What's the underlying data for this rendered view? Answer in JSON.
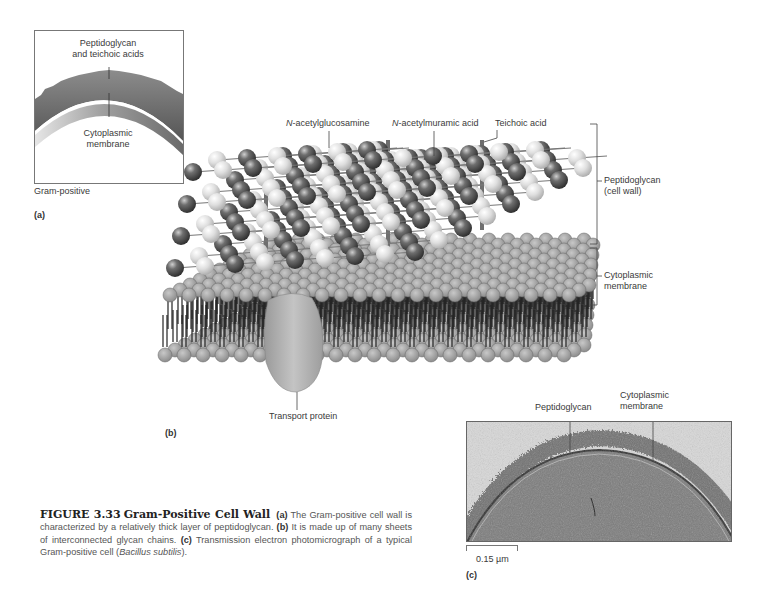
{
  "figure": {
    "number": "FIGURE 3.33",
    "title": "Gram-Positive Cell Wall",
    "caption_parts": [
      {
        "bold": "(a)",
        "text": " The Gram-positive cell wall is characterized by a relatively thick layer of peptidoglycan. "
      },
      {
        "bold": "(b)",
        "text": " It is made up of many sheets of interconnected glycan chains. "
      },
      {
        "bold": "(c)",
        "text": " Transmission electron photomicrograph of a typical Gram-positive cell ("
      },
      {
        "italic": "Bacillus subtilis"
      },
      {
        "text": ")."
      }
    ]
  },
  "panel_a": {
    "letter": "(a)",
    "label_top_line1": "Peptidoglycan",
    "label_top_line2": "and teichoic acids",
    "label_bottom_line1": "Cytoplasmic",
    "label_bottom_line2": "membrane",
    "cell_type": "Gram-positive",
    "colors": {
      "wall": "#6f6f6f",
      "membrane_light": "#d9d9d9",
      "membrane_dark": "#8a8a8a"
    }
  },
  "panel_b": {
    "letter": "(b)",
    "labels": {
      "nag": {
        "prefix": "N",
        "text": "-acetylglucosamine"
      },
      "nam": {
        "prefix": "N",
        "text": "-acetylmuramic acid"
      },
      "teichoic": "Teichoic acid",
      "peptidoglycan_line1": "Peptidoglycan",
      "peptidoglycan_line2": "(cell wall)",
      "membrane_line1": "Cytoplasmic",
      "membrane_line2": "membrane",
      "transport": "Transport protein"
    },
    "colors": {
      "dark_sphere": "#4a4a4a",
      "light_sphere": "#d4d4d4",
      "lipid_head": "#a8a8a8",
      "protein": "#b5b5b5"
    }
  },
  "panel_c": {
    "letter": "(c)",
    "label_peptidoglycan": "Peptidoglycan",
    "label_membrane_line1": "Cytoplasmic",
    "label_membrane_line2": "membrane",
    "scale_bar": "0.15 µm"
  }
}
